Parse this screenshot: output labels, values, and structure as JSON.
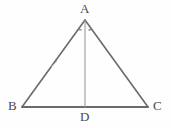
{
  "figure": {
    "kind": "geometry-diagram",
    "shape": "isosceles-triangle-with-altitude",
    "background_color": "#fefefe",
    "stroke_color": "#6a6a6a",
    "altitude_stroke_color": "#9a9a9a",
    "label_color": "#4a4a4a",
    "labels": {
      "apex": "A",
      "bottom_left": "B",
      "bottom_right": "C",
      "foot": "D"
    },
    "points": {
      "A": {
        "x": 85,
        "y": 20
      },
      "B": {
        "x": 22,
        "y": 107
      },
      "C": {
        "x": 148,
        "y": 107
      },
      "D": {
        "x": 85,
        "y": 107
      }
    },
    "segments": [
      {
        "name": "AB",
        "from": "A",
        "to": "B"
      },
      {
        "name": "AC",
        "from": "A",
        "to": "C"
      },
      {
        "name": "BC",
        "from": "B",
        "to": "C"
      },
      {
        "name": "AD",
        "from": "A",
        "to": "D"
      }
    ],
    "angle_marks": {
      "at": "A",
      "count": 2,
      "meaning": "equal-angles-BAD-and-DAC"
    },
    "tick_marks": {
      "on": "AB",
      "count": 1
    }
  }
}
